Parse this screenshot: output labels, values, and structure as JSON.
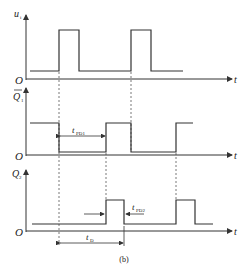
{
  "diagram": {
    "caption": "(b)",
    "origin_label": "O",
    "time_label": "t",
    "signals": [
      {
        "name": "u_i",
        "label_main": "u",
        "label_sub": "i"
      },
      {
        "name": "Q1_bar",
        "label_main": "Q",
        "label_sub": "1",
        "overbar": true
      },
      {
        "name": "Q2",
        "label_main": "Q",
        "label_sub": "2"
      }
    ],
    "annotations": {
      "tpd1_main": "t",
      "tpd1_sub": "PD1",
      "tpd2_main": "t",
      "tpd2_sub": "PD2",
      "td_main": "t",
      "td_sub": "D"
    },
    "colors": {
      "line": "#333333",
      "dash": "#555555"
    }
  }
}
